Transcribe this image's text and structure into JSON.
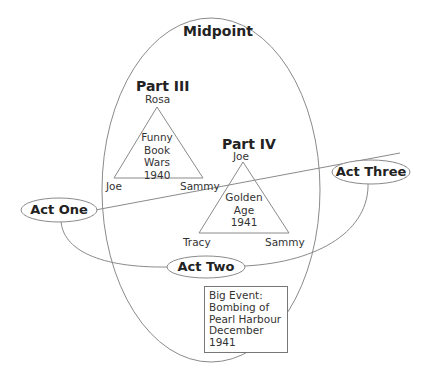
{
  "diagram": {
    "midpoint": {
      "label": "Midpoint"
    },
    "part3": {
      "title": "Part III",
      "top": "Rosa",
      "left": "Joe",
      "right": "Sammy",
      "center": [
        "Funny",
        "Book",
        "Wars",
        "1940"
      ]
    },
    "part4": {
      "title": "Part IV",
      "top": "Joe",
      "left": "Tracy",
      "right": "Sammy",
      "center": [
        "Golden",
        "Age",
        "1941"
      ]
    },
    "acts": {
      "one": "Act One",
      "two": "Act Two",
      "three": "Act Three"
    },
    "event": {
      "lines": [
        "Big Event:",
        "Bombing of",
        "Pearl Harbour",
        "December",
        "1941"
      ]
    },
    "colors": {
      "line": "#8a8a8a",
      "text": "#2a2a2a",
      "background": "#ffffff"
    }
  }
}
